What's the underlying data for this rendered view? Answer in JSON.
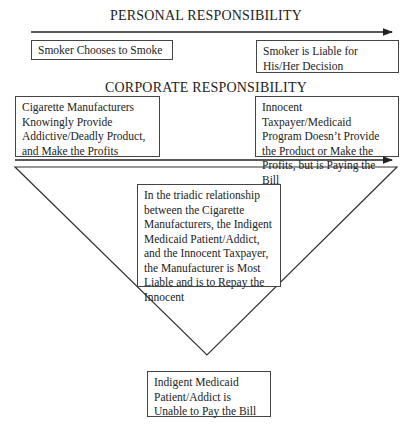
{
  "personal": {
    "heading": "PERSONAL RESPONSIBILITY",
    "left_box": "Smoker Chooses to Smoke",
    "right_box": "Smoker is Liable for His/Her Decision"
  },
  "corporate": {
    "heading": "CORPORATE RESPONSIBILITY",
    "left_box": "Cigarette Manufacturers Knowingly Provide Addictive/Deadly Product, and Make the Profits",
    "right_box": "Innocent Taxpayer/Medicaid Program Doesn’t Provide the Product or Make the Profits, but is Paying the Bill"
  },
  "triangle": {
    "center_box": "In the triadic relationship between the Cigarette Manufacturers, the Indigent Medicaid Patient/Addict, and the Innocent Taxpayer, the Manufacturer is Most Liable and is to Repay the Innocent",
    "bottom_box": "Indigent Medicaid Patient/Addict is Unable to Pay the Bill"
  },
  "colors": {
    "line": "#333333",
    "text": "#222222",
    "background": "#ffffff"
  }
}
